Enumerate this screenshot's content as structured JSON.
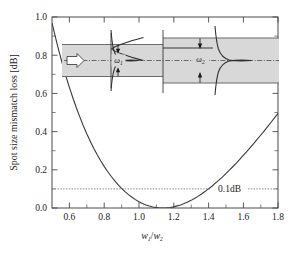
{
  "chart_data": {
    "type": "line",
    "title": "",
    "xlabel": "w1/w2",
    "xlabel_main": "w",
    "xlabel_sub1": "1",
    "xlabel_slash": "/",
    "xlabel_main2": "w",
    "xlabel_sub2": "2",
    "ylabel": "Spot size mismatch loss [dB]",
    "xlim": [
      0.5,
      1.8
    ],
    "ylim": [
      0.0,
      1.0
    ],
    "grid": false,
    "legend": "none",
    "xticks": [
      0.6,
      0.8,
      1.0,
      1.2,
      1.4,
      1.6,
      1.8
    ],
    "xtick_labels": [
      "0.6",
      "0.8",
      "1.0",
      "1.2",
      "1.4",
      "1.6",
      "1.8"
    ],
    "xticks_minor": [
      0.5,
      0.7,
      0.9,
      1.1,
      1.3,
      1.5,
      1.7
    ],
    "yticks": [
      0.0,
      0.2,
      0.4,
      0.6,
      0.8,
      1.0
    ],
    "ytick_labels": [
      "0.0",
      "0.2",
      "0.4",
      "0.6",
      "0.8",
      "1.0"
    ],
    "yticks_minor": [
      0.1,
      0.3,
      0.5,
      0.7,
      0.9
    ],
    "series": [
      {
        "name": "Spot size mismatch loss",
        "x": [
          0.5,
          0.52,
          0.54,
          0.56,
          0.58,
          0.6,
          0.62,
          0.64,
          0.66,
          0.68,
          0.7,
          0.72,
          0.74,
          0.76,
          0.78,
          0.8,
          0.82,
          0.84,
          0.86,
          0.88,
          0.9,
          0.92,
          0.94,
          0.96,
          0.98,
          1.0,
          1.02,
          1.04,
          1.06,
          1.08,
          1.1,
          1.12,
          1.14,
          1.16,
          1.18,
          1.2,
          1.22,
          1.24,
          1.26,
          1.28,
          1.3,
          1.32,
          1.34,
          1.36,
          1.38,
          1.4,
          1.42,
          1.44,
          1.46,
          1.48,
          1.5,
          1.52,
          1.54,
          1.56,
          1.58,
          1.6,
          1.62,
          1.64,
          1.66,
          1.68,
          1.7,
          1.72,
          1.74,
          1.76,
          1.78,
          1.8
        ],
        "y": [
          0.969,
          0.893,
          0.821,
          0.754,
          0.691,
          0.632,
          0.577,
          0.525,
          0.477,
          0.431,
          0.389,
          0.35,
          0.313,
          0.279,
          0.247,
          0.218,
          0.191,
          0.166,
          0.143,
          0.122,
          0.103,
          0.086,
          0.07,
          0.056,
          0.044,
          0.033,
          0.024,
          0.016,
          0.01,
          0.005,
          0.002,
          0.0,
          0.0,
          0.001,
          0.003,
          0.006,
          0.011,
          0.016,
          0.023,
          0.031,
          0.04,
          0.05,
          0.061,
          0.073,
          0.086,
          0.1,
          0.114,
          0.13,
          0.146,
          0.162,
          0.18,
          0.198,
          0.216,
          0.235,
          0.255,
          0.275,
          0.295,
          0.316,
          0.337,
          0.359,
          0.381,
          0.403,
          0.426,
          0.449,
          0.472,
          0.495
        ],
        "color": "#3a3a3a",
        "style": "solid"
      }
    ],
    "annotations": [
      {
        "name": "threshold",
        "type": "hline",
        "value": 0.1,
        "label": "0.1dB",
        "style": "dotted",
        "color": "#777777"
      }
    ]
  },
  "axes": {
    "ylabel_text": "Spot size mismatch loss [dB]"
  },
  "inset": {
    "name": "waveguide-mode-mismatch-diagram",
    "left_waveguide_label": "ω",
    "left_waveguide_sub": "1",
    "right_waveguide_label": "ω",
    "right_waveguide_sub": "2",
    "input_arrow": "propagation-direction-arrow",
    "fill_color": "#d8d8d8",
    "edge_color": "#6b6b6b"
  },
  "colors": {
    "curve": "#3a3a3a",
    "threshold": "#777777",
    "frame": "#4a4a4a",
    "text": "#1a1a1a",
    "inset_fill": "#d8d8d8",
    "background": "#ffffff"
  }
}
